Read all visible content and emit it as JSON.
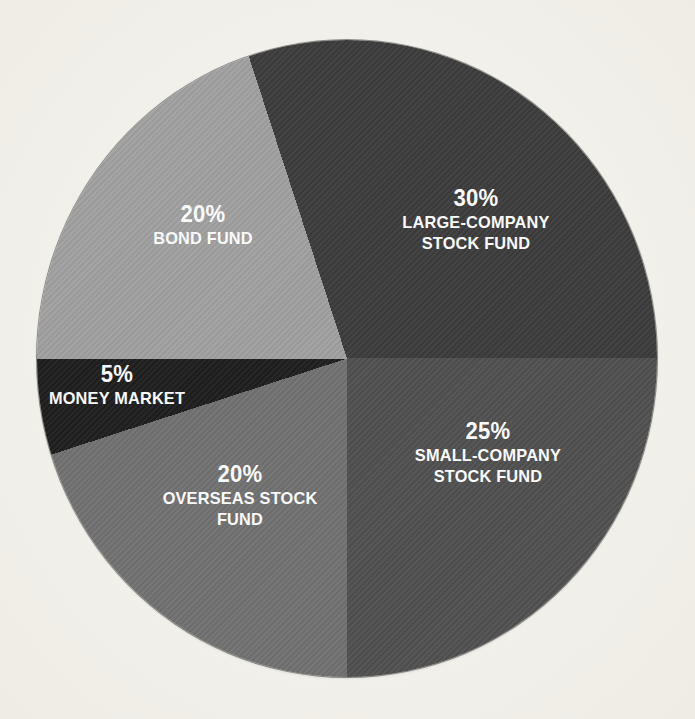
{
  "page": {
    "background_color": "#f2f0ea"
  },
  "chart_data": {
    "type": "pie",
    "title": "",
    "legend": "none",
    "direction": "clockwise",
    "start_angle_deg": -18,
    "label_text_color": "#ffffff",
    "slices": [
      {
        "name": "Large-company stock fund",
        "pct": "30%",
        "value": 30,
        "color": "#3c3c3c",
        "label": {
          "lines": "LARGE-COMPANY\nSTOCK FUND",
          "x": 439,
          "y": 179
        }
      },
      {
        "name": "Small-company stock fund",
        "pct": "25%",
        "value": 25,
        "color": "#505050",
        "label": {
          "lines": "SMALL-COMPANY\nSTOCK FUND",
          "x": 451,
          "y": 412
        }
      },
      {
        "name": "Overseas stock fund",
        "pct": "20%",
        "value": 20,
        "color": "#717171",
        "label": {
          "lines": "OVERSEAS STOCK\nFUND",
          "x": 203,
          "y": 455
        }
      },
      {
        "name": "Money market",
        "pct": "5%",
        "value": 5,
        "color": "#1e1e1e",
        "label": {
          "lines": "MONEY MARKET",
          "x": 80,
          "y": 345
        }
      },
      {
        "name": "Bond fund",
        "pct": "20%",
        "value": 20,
        "color": "#a0a0a0",
        "label": {
          "lines": "BOND FUND",
          "x": 166,
          "y": 185
        }
      }
    ]
  }
}
